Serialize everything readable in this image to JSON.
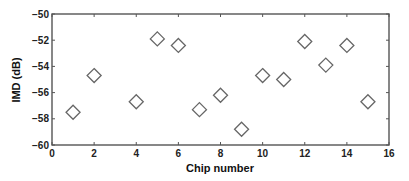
{
  "chart_data": {
    "type": "scatter",
    "title": "",
    "xlabel": "Chip number",
    "ylabel": "IMD (dB)",
    "xlim": [
      0,
      16
    ],
    "ylim": [
      -60,
      -50
    ],
    "xticks": [
      0,
      2,
      4,
      6,
      8,
      10,
      12,
      14,
      16
    ],
    "yticks": [
      -60,
      -58,
      -56,
      -54,
      -52,
      -50
    ],
    "grid": false,
    "legend": null,
    "marker": "diamond",
    "series": [
      {
        "name": "IMD",
        "points": [
          {
            "x": 1,
            "y": -57.5
          },
          {
            "x": 2,
            "y": -54.7
          },
          {
            "x": 4,
            "y": -56.7
          },
          {
            "x": 5,
            "y": -51.9
          },
          {
            "x": 6,
            "y": -52.4
          },
          {
            "x": 7,
            "y": -57.3
          },
          {
            "x": 8,
            "y": -56.2
          },
          {
            "x": 9,
            "y": -58.8
          },
          {
            "x": 10,
            "y": -54.7
          },
          {
            "x": 11,
            "y": -55.0
          },
          {
            "x": 12,
            "y": -52.1
          },
          {
            "x": 13,
            "y": -53.9
          },
          {
            "x": 14,
            "y": -52.4
          },
          {
            "x": 15,
            "y": -56.7
          }
        ]
      }
    ]
  },
  "colors": {
    "axis": "#555555",
    "marker": "#666666"
  }
}
